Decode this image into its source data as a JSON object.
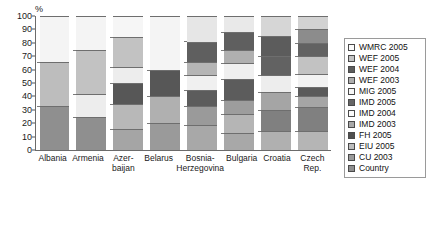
{
  "chart_data": {
    "type": "bar",
    "subtype": "stacked-100-percent",
    "title": "",
    "xlabel": "",
    "ylabel": "%",
    "ylim": [
      0,
      100
    ],
    "yticks": [
      0,
      10,
      20,
      30,
      40,
      50,
      60,
      70,
      80,
      90,
      100
    ],
    "grid": false,
    "legend_position": "right",
    "categories": [
      "Albania",
      "Armenia",
      "Azer-\nbaijan",
      "Belarus",
      "Bosnia-\nHerzegovina",
      "Bulgaria",
      "Croatia",
      "Czech\nRep."
    ],
    "series": [
      {
        "name": "Country",
        "color": "#8f8f8f",
        "values": [
          33,
          25,
          16,
          20,
          19,
          13,
          14,
          14
        ]
      },
      {
        "name": "CU 2003",
        "color": "#a8a8a8",
        "values": [
          0,
          0,
          18,
          20,
          14,
          14,
          16,
          18
        ]
      },
      {
        "name": "EIU 2005",
        "color": "#bdbdbd",
        "values": [
          0,
          17,
          16,
          0,
          12,
          10,
          13,
          8
        ]
      },
      {
        "name": "FH 2005",
        "color": "#545454",
        "values": [
          0,
          0,
          12,
          20,
          11,
          16,
          13,
          7
        ]
      },
      {
        "name": "IMD 2003",
        "color": "#9d9d9d",
        "values": [
          33,
          33,
          22,
          0,
          10,
          12,
          14,
          10
        ]
      },
      {
        "name": "IMD 2004",
        "color": "#f2f2f2",
        "values": [
          0,
          0,
          0,
          0,
          15,
          10,
          15,
          13
        ]
      },
      {
        "name": "IMD 2005",
        "color": "#5f5f5f",
        "values": [
          0,
          0,
          0,
          0,
          0,
          10,
          0,
          10
        ]
      },
      {
        "name": "MIG 2005",
        "color": "#ededed",
        "values": [
          0,
          0,
          0,
          0,
          0,
          0,
          0,
          10
        ]
      },
      {
        "name": "WEF 2003",
        "color": "#b5b5b5",
        "values": [
          0,
          0,
          0,
          0,
          0,
          0,
          0,
          0
        ]
      },
      {
        "name": "WEF 2004",
        "color": "#5a5a5a",
        "values": [
          0,
          0,
          0,
          0,
          0,
          0,
          0,
          0
        ]
      },
      {
        "name": "WEF 2005",
        "color": "#c9c9c9",
        "values": [
          0,
          0,
          0,
          0,
          0,
          0,
          0,
          0
        ]
      },
      {
        "name": "WMRC 2005",
        "color": "#f7f7f7",
        "values": [
          34,
          25,
          16,
          40,
          19,
          15,
          15,
          10
        ]
      }
    ],
    "stacks": [
      {
        "category": "Albania",
        "segments": [
          {
            "label": "Country",
            "from": 0,
            "to": 33,
            "size": 33,
            "color": "#8f8f8f"
          },
          {
            "label": "IMD 2003",
            "from": 33,
            "to": 66,
            "size": 33,
            "color": "#bdbdbd"
          },
          {
            "label": "WMRC 2005",
            "from": 66,
            "to": 100,
            "size": 34,
            "color": "#f4f4f4"
          }
        ]
      },
      {
        "category": "Armenia",
        "segments": [
          {
            "label": "Country",
            "from": 0,
            "to": 25,
            "size": 25,
            "color": "#8f8f8f"
          },
          {
            "label": "EIU 2005",
            "from": 25,
            "to": 42,
            "size": 17,
            "color": "#ededed"
          },
          {
            "label": "IMD 2003",
            "from": 42,
            "to": 75,
            "size": 33,
            "color": "#c2c2c2"
          },
          {
            "label": "WMRC 2005",
            "from": 75,
            "to": 100,
            "size": 25,
            "color": "#f4f4f4"
          }
        ]
      },
      {
        "category": "Azer-\nbaijan",
        "segments": [
          {
            "label": "Country",
            "from": 0,
            "to": 16,
            "size": 16,
            "color": "#a5a5a5"
          },
          {
            "label": "CU 2003",
            "from": 16,
            "to": 34,
            "size": 18,
            "color": "#b8b8b8"
          },
          {
            "label": "FH 2005",
            "from": 34,
            "to": 50,
            "size": 16,
            "color": "#575757"
          },
          {
            "label": "IMD 2004",
            "from": 50,
            "to": 62,
            "size": 12,
            "color": "#ededed"
          },
          {
            "label": "IMD 2003",
            "from": 62,
            "to": 84,
            "size": 22,
            "color": "#c2c2c2"
          },
          {
            "label": "WMRC 2005",
            "from": 84,
            "to": 100,
            "size": 16,
            "color": "#f6f6f6"
          }
        ]
      },
      {
        "category": "Belarus",
        "segments": [
          {
            "label": "Country",
            "from": 0,
            "to": 20,
            "size": 20,
            "color": "#9a9a9a"
          },
          {
            "label": "CU 2003",
            "from": 20,
            "to": 40,
            "size": 20,
            "color": "#b0b0b0"
          },
          {
            "label": "FH 2005",
            "from": 40,
            "to": 60,
            "size": 20,
            "color": "#575757"
          },
          {
            "label": "WMRC 2005",
            "from": 60,
            "to": 100,
            "size": 40,
            "color": "#f4f4f4"
          }
        ]
      },
      {
        "category": "Bosnia-\nHerzegovina",
        "segments": [
          {
            "label": "Country",
            "from": 0,
            "to": 19,
            "size": 19,
            "color": "#a8a8a8"
          },
          {
            "label": "CU 2003",
            "from": 19,
            "to": 33,
            "size": 14,
            "color": "#9a9a9a"
          },
          {
            "label": "FH 2005",
            "from": 33,
            "to": 45,
            "size": 12,
            "color": "#5c5c5c"
          },
          {
            "label": "IMD 2004",
            "from": 45,
            "to": 56,
            "size": 11,
            "color": "#f0f0f0"
          },
          {
            "label": "EIU 2005",
            "from": 56,
            "to": 66,
            "size": 10,
            "color": "#b5b5b5"
          },
          {
            "label": "IMD 2003",
            "from": 66,
            "to": 81,
            "size": 15,
            "color": "#5f5f5f"
          },
          {
            "label": "WMRC 2005",
            "from": 81,
            "to": 100,
            "size": 19,
            "color": "#e6e6e6"
          }
        ]
      },
      {
        "category": "Bulgaria",
        "segments": [
          {
            "label": "Country",
            "from": 0,
            "to": 13,
            "size": 13,
            "color": "#a8a8a8"
          },
          {
            "label": "CU 2003",
            "from": 13,
            "to": 27,
            "size": 14,
            "color": "#b5b5b5"
          },
          {
            "label": "EIU 2005",
            "from": 27,
            "to": 37,
            "size": 10,
            "color": "#9d9d9d"
          },
          {
            "label": "FH 2005",
            "from": 37,
            "to": 53,
            "size": 16,
            "color": "#5c5c5c"
          },
          {
            "label": "IMD 2004",
            "from": 53,
            "to": 65,
            "size": 12,
            "color": "#f0f0f0"
          },
          {
            "label": "IMD 2003",
            "from": 65,
            "to": 75,
            "size": 10,
            "color": "#b0b0b0"
          },
          {
            "label": "IMD 2005",
            "from": 75,
            "to": 88,
            "size": 13,
            "color": "#5f5f5f"
          },
          {
            "label": "WMRC 2005",
            "from": 88,
            "to": 100,
            "size": 12,
            "color": "#e9e9e9"
          }
        ]
      },
      {
        "category": "Croatia",
        "segments": [
          {
            "label": "Country",
            "from": 0,
            "to": 14,
            "size": 14,
            "color": "#b0b0b0"
          },
          {
            "label": "CU 2003",
            "from": 14,
            "to": 30,
            "size": 16,
            "color": "#808080"
          },
          {
            "label": "EIU 2005",
            "from": 30,
            "to": 43,
            "size": 13,
            "color": "#a5a5a5"
          },
          {
            "label": "IMD 2004",
            "from": 43,
            "to": 56,
            "size": 13,
            "color": "#ededed"
          },
          {
            "label": "FH 2005",
            "from": 56,
            "to": 70,
            "size": 14,
            "color": "#626262"
          },
          {
            "label": "IMD 2003",
            "from": 70,
            "to": 85,
            "size": 15,
            "color": "#5c5c5c"
          },
          {
            "label": "WMRC 2005",
            "from": 85,
            "to": 100,
            "size": 15,
            "color": "#d6d6d6"
          }
        ]
      },
      {
        "category": "Czech\nRep.",
        "segments": [
          {
            "label": "Country",
            "from": 0,
            "to": 14,
            "size": 14,
            "color": "#b5b5b5"
          },
          {
            "label": "CU 2003",
            "from": 14,
            "to": 32,
            "size": 18,
            "color": "#808080"
          },
          {
            "label": "EIU 2005",
            "from": 32,
            "to": 40,
            "size": 8,
            "color": "#a5a5a5"
          },
          {
            "label": "FH 2005",
            "from": 40,
            "to": 47,
            "size": 7,
            "color": "#5a5a5a"
          },
          {
            "label": "MIG 2005",
            "from": 47,
            "to": 57,
            "size": 10,
            "color": "#f2f2f2"
          },
          {
            "label": "IMD 2004",
            "from": 57,
            "to": 70,
            "size": 13,
            "color": "#c2c2c2"
          },
          {
            "label": "IMD 2005",
            "from": 70,
            "to": 80,
            "size": 10,
            "color": "#626262"
          },
          {
            "label": "IMD 2003",
            "from": 80,
            "to": 90,
            "size": 10,
            "color": "#8c8c8c"
          },
          {
            "label": "WMRC 2005",
            "from": 90,
            "to": 100,
            "size": 10,
            "color": "#d2d2d2"
          }
        ]
      }
    ],
    "legend": [
      {
        "label": "WMRC 2005",
        "color": "#fbfbfb"
      },
      {
        "label": "WEF 2005",
        "color": "#c4c4c4"
      },
      {
        "label": "WEF 2004",
        "color": "#5c5c5c"
      },
      {
        "label": "WEF 2003",
        "color": "#aeaeae"
      },
      {
        "label": "MIG 2005",
        "color": "#f7f7f7"
      },
      {
        "label": "IMD 2005",
        "color": "#666666"
      },
      {
        "label": "IMD 2004",
        "color": "#fbfbfb"
      },
      {
        "label": "IMD 2003",
        "color": "#a8a8a8"
      },
      {
        "label": "FH 2005",
        "color": "#4f4f4f"
      },
      {
        "label": "EIU 2005",
        "color": "#bdbdbd"
      },
      {
        "label": "CU 2003",
        "color": "#9a9a9a"
      },
      {
        "label": "Country",
        "color": "#8f8f8f"
      }
    ]
  }
}
